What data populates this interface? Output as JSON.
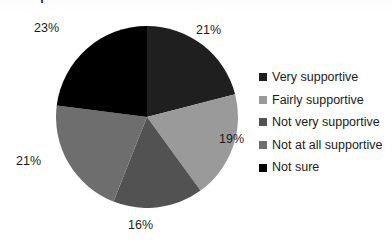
{
  "chart_data": {
    "type": "pie",
    "title": "Perceptions of Sharia Law and Britishness for Muslims in Britain",
    "categories": [
      "Very supportive",
      "Fairly supportive",
      "Not very supportive",
      "Not at all supportive",
      "Not sure"
    ],
    "values": [
      21,
      19,
      16,
      21,
      23
    ],
    "value_labels": [
      "21%",
      "19%",
      "16%",
      "21%",
      "23%"
    ],
    "colors": [
      "#1f1f1f",
      "#9a9a9a",
      "#525252",
      "#6e6e6e",
      "#000000"
    ],
    "legend_position": "right",
    "start_angle_deg": 0,
    "direction": "clockwise",
    "grid": false,
    "xlabel": "",
    "ylabel": ""
  },
  "legend": {
    "items": [
      {
        "label": "Very supportive",
        "color": "#1f1f1f"
      },
      {
        "label": "Fairly supportive",
        "color": "#9a9a9a"
      },
      {
        "label": "Not very supportive",
        "color": "#525252"
      },
      {
        "label": "Not at all supportive",
        "color": "#6e6e6e"
      },
      {
        "label": "Not sure",
        "color": "#000000"
      }
    ]
  }
}
